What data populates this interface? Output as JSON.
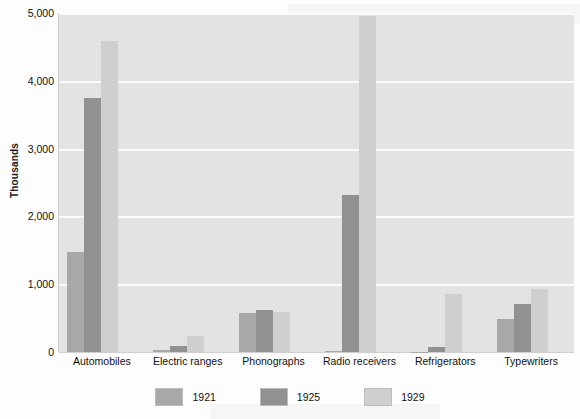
{
  "chart_data": {
    "type": "bar",
    "title": "",
    "xlabel": "",
    "ylabel": "Thousands",
    "ylim": [
      0,
      5000
    ],
    "yticks": [
      "0",
      "1,000",
      "2,000",
      "3,000",
      "4,000",
      "5,000"
    ],
    "ytick_values": [
      0,
      1000,
      2000,
      3000,
      4000,
      5000
    ],
    "grid": true,
    "legend_position": "bottom",
    "categories": [
      "Automobiles",
      "Electric ranges",
      "Phonographs",
      "Radio receivers",
      "Refrigerators",
      "Typewriters"
    ],
    "series": [
      {
        "name": "1921",
        "color": "#a8a8a8",
        "values": [
          1480,
          30,
          580,
          10,
          5,
          480
        ]
      },
      {
        "name": "1925",
        "color": "#919191",
        "values": [
          3740,
          90,
          620,
          2320,
          75,
          710
        ]
      },
      {
        "name": "1929",
        "color": "#cfcfcf",
        "values": [
          4580,
          230,
          590,
          4950,
          860,
          930
        ]
      }
    ]
  },
  "legend": {
    "items": [
      {
        "label": "1921"
      },
      {
        "label": "1925"
      },
      {
        "label": "1929"
      }
    ]
  }
}
